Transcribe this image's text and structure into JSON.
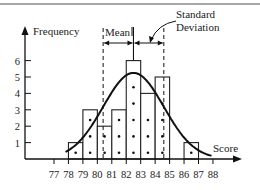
{
  "chart_data": {
    "type": "bar",
    "title": "",
    "xlabel": "Score",
    "ylabel": "Frequency",
    "x_ticks": [
      "77",
      "78",
      "79",
      "80",
      "81",
      "82",
      "83",
      "84",
      "85",
      "86",
      "87",
      "88"
    ],
    "y_ticks": [
      "1",
      "2",
      "3",
      "4",
      "5",
      "6"
    ],
    "bins": [
      {
        "from": 78,
        "to": 79,
        "value": 1
      },
      {
        "from": 79,
        "to": 80,
        "value": 3
      },
      {
        "from": 80,
        "to": 81,
        "value": 2
      },
      {
        "from": 81,
        "to": 82,
        "value": 3
      },
      {
        "from": 82,
        "to": 83,
        "value": 6
      },
      {
        "from": 83,
        "to": 84,
        "value": 4
      },
      {
        "from": 84,
        "to": 85,
        "value": 5
      },
      {
        "from": 86,
        "to": 87,
        "value": 1
      }
    ],
    "categories": [
      "78-79",
      "79-80",
      "80-81",
      "81-82",
      "82-83",
      "83-84",
      "84-85",
      "85-86",
      "86-87",
      "87-88"
    ],
    "values": [
      1,
      3,
      2,
      3,
      6,
      4,
      5,
      0,
      1,
      0
    ],
    "overlay": {
      "type": "normal-curve",
      "mean": 82.5,
      "std_dev": 2.1
    },
    "annotations": {
      "mean_label": "Mean",
      "std_label_line1": "Standard",
      "std_label_line2": "Deviation"
    },
    "ylim": [
      0,
      7
    ],
    "xlim": [
      76,
      89
    ],
    "grid": false,
    "legend": "none"
  }
}
